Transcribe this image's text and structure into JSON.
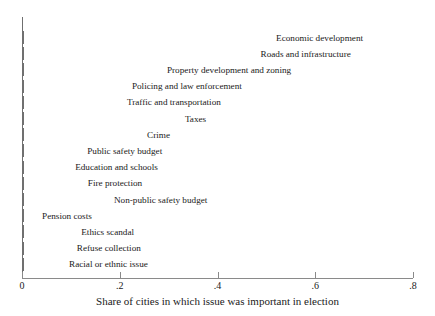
{
  "chart_data": {
    "type": "bar",
    "orientation": "horizontal",
    "title": "",
    "xlabel": "Share of cities in which issue was important in election",
    "ylabel": "",
    "xlim": [
      0,
      0.8
    ],
    "grid": false,
    "legend": null,
    "xticks": [
      "0",
      ".2",
      ".4",
      ".6",
      ".8"
    ],
    "xtick_values": [
      0,
      0.2,
      0.4,
      0.6,
      0.8
    ],
    "categories": [
      "Economic development",
      "Roads and infrastructure",
      "Property development and zoning",
      "Policing and law enforcement",
      "Traffic and transportation",
      "Taxes",
      "Crime",
      "Public safety budget",
      "Education and schools",
      "Fire protection",
      "Non-public safety budget",
      "Pension costs",
      "Ethics scandal",
      "Refuse collection",
      "Racial or ethnic issue"
    ],
    "values": [
      0.704,
      0.679,
      0.557,
      0.456,
      0.413,
      0.383,
      0.309,
      0.293,
      0.284,
      0.252,
      0.18,
      0.149,
      0.113,
      0.104,
      0.088
    ],
    "label_placement": [
      "inside",
      "inside",
      "inside",
      "inside",
      "inside",
      "inside",
      "inside",
      "inside",
      "inside",
      "inside",
      "outside",
      "inside",
      "outside",
      "outside",
      "outside"
    ],
    "colors": {
      "bar_fill": "#ffffff",
      "bar_border": "#707070",
      "axis": "#8a8a8a",
      "text": "#1a1a1a",
      "background": "#ffffff"
    }
  }
}
